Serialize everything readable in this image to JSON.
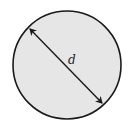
{
  "diagram": {
    "shape": "circle",
    "fill_color": "#e6e6e6",
    "stroke_color": "#1a1a1a",
    "dimension_label": "d",
    "dimension_meaning": "diameter"
  }
}
